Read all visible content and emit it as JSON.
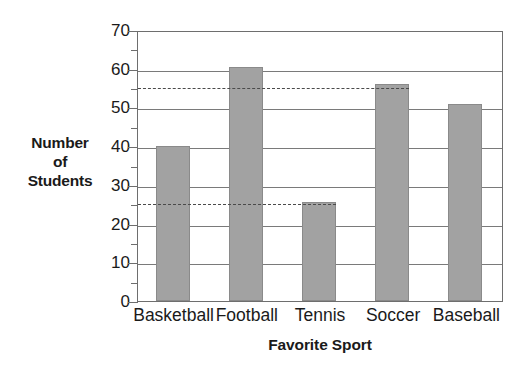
{
  "chart_data": {
    "type": "bar",
    "title": "",
    "categories": [
      "Basketball",
      "Football",
      "Tennis",
      "Soccer",
      "Baseball"
    ],
    "values": [
      40,
      60.5,
      25.5,
      56,
      51
    ],
    "xlabel": "Favorite Sport",
    "ylabel": "Number of Students",
    "ylabel_lines": [
      "Number",
      "of",
      "Students"
    ],
    "ylim": [
      0,
      70
    ],
    "ytick_labels": [
      "0",
      "10",
      "20",
      "30",
      "40",
      "50",
      "60",
      "70"
    ],
    "ytick_values": [
      0,
      10,
      20,
      30,
      40,
      50,
      60,
      70
    ],
    "yminor_values": [
      5,
      15,
      25,
      35,
      45,
      55,
      65
    ],
    "grid": "horizontal",
    "legend": "none",
    "bar_color": "#a2a2a2",
    "bar_edge_color": "#8a8a8a",
    "axis_color": "#6e6e6e",
    "gridline_color": "#7a7a7a",
    "reference_lines": [
      {
        "value": 55.5,
        "start_category": "Basketball",
        "end_category": "Soccer",
        "style": "dashed",
        "color": "#4a4a4a"
      },
      {
        "value": 25.5,
        "start_category": "Basketball",
        "end_category": "Tennis",
        "style": "dashed",
        "color": "#4a4a4a"
      }
    ]
  }
}
